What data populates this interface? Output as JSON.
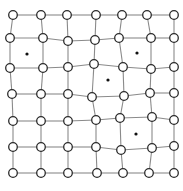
{
  "diagram": {
    "type": "deformed-grid-graph",
    "rows": 7,
    "cols": 7,
    "node_radius": 4.3,
    "dot_radius": 1.6,
    "colors": {
      "edge": "#8a8a8a",
      "node_fill": "#ffffff",
      "node_stroke": "#2a2a2a",
      "dot": "#111111",
      "background": "#ffffff"
    },
    "nodes": [
      [
        [
          13,
          15
        ],
        [
          41,
          15
        ],
        [
          67,
          15
        ],
        [
          96,
          15
        ],
        [
          122,
          15
        ],
        [
          147,
          15
        ],
        [
          174,
          15
        ]
      ],
      [
        [
          10,
          38
        ],
        [
          43,
          38
        ],
        [
          68,
          41
        ],
        [
          95,
          40
        ],
        [
          119,
          38
        ],
        [
          151,
          38
        ],
        [
          174,
          38
        ]
      ],
      [
        [
          10,
          68
        ],
        [
          43,
          68
        ],
        [
          68,
          67
        ],
        [
          94,
          64
        ],
        [
          123,
          67
        ],
        [
          151,
          69
        ],
        [
          174,
          67
        ]
      ],
      [
        [
          12,
          94
        ],
        [
          41,
          94
        ],
        [
          68,
          94
        ],
        [
          92,
          97
        ],
        [
          124,
          96
        ],
        [
          150,
          93
        ],
        [
          174,
          93
        ]
      ],
      [
        [
          13,
          121
        ],
        [
          41,
          121
        ],
        [
          68,
          121
        ],
        [
          96,
          120
        ],
        [
          120,
          118
        ],
        [
          152,
          117
        ],
        [
          174,
          120
        ]
      ],
      [
        [
          13,
          147
        ],
        [
          41,
          147
        ],
        [
          68,
          147
        ],
        [
          96,
          147
        ],
        [
          121,
          150
        ],
        [
          152,
          148
        ],
        [
          174,
          146
        ]
      ],
      [
        [
          13,
          173
        ],
        [
          41,
          173
        ],
        [
          68,
          173
        ],
        [
          97,
          173
        ],
        [
          123,
          173
        ],
        [
          149,
          173
        ],
        [
          174,
          173
        ]
      ]
    ],
    "dots": [
      [
        27,
        54
      ],
      [
        137,
        53
      ],
      [
        108,
        80
      ],
      [
        136,
        134
      ]
    ]
  }
}
